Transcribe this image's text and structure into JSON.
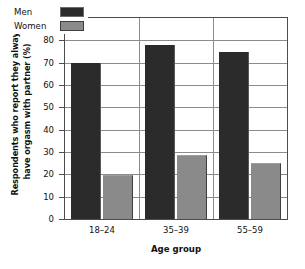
{
  "chart_data": {
    "type": "bar",
    "title": "",
    "categories": [
      "18–24",
      "35–39",
      "55–59"
    ],
    "series": [
      {
        "name": "Men",
        "values": [
          70,
          78,
          75
        ],
        "color": "#2b2b2b"
      },
      {
        "name": "Women",
        "values": [
          19.5,
          28.5,
          25
        ],
        "color": "#8a8a8a"
      }
    ],
    "xlabel": "Age group",
    "ylabel": "Respondents who report they always have orgasm with partner (%)",
    "ylabel_lines": [
      "Respondents who report they always",
      "have orgasm with partner (%)"
    ],
    "ylim": [
      0,
      90
    ],
    "ytick_labels": [
      "0",
      "10",
      "20",
      "30",
      "40",
      "50",
      "60",
      "70",
      "80",
      "90"
    ],
    "ytick_values": [
      0,
      10,
      20,
      30,
      40,
      50,
      60,
      70,
      80,
      90
    ],
    "grid": true,
    "legend_position": "top-left",
    "legend_entries": [
      {
        "label": "Men",
        "swatch": "dark-square-swatch"
      },
      {
        "label": "Women",
        "swatch": "gray-square-swatch"
      }
    ],
    "colors": {
      "men": "#2b2b2b",
      "women": "#8a8a8a",
      "grid": "#8c8c8c",
      "axis": "#4d4d4d",
      "background": "#ffffff",
      "text": "#111111"
    }
  }
}
